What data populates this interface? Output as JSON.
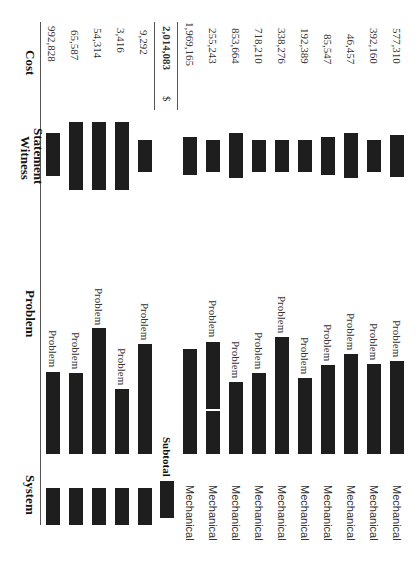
{
  "table": {
    "headers": {
      "system": "System",
      "problem": "Problem",
      "witness_statement_line1": "Witness",
      "witness_statement_line2": "Statement",
      "cost": "Cost"
    },
    "group1_rows": [
      {
        "system": "[redacted]",
        "problem": "Problem",
        "witness": "[redacted]",
        "cost": "992,828"
      },
      {
        "system": "[redacted]",
        "problem": "Problem",
        "witness": "[redacted]",
        "cost": "65,587"
      },
      {
        "system": "[redacted]",
        "problem": "Problem",
        "witness": "[redacted]",
        "cost": "54,314"
      },
      {
        "system": "[redacted]",
        "problem": "Problem",
        "witness": "[redacted]",
        "cost": "3,416"
      },
      {
        "system": "[redacted]",
        "problem": "Problem",
        "witness": "[redacted]",
        "cost": "9,292"
      }
    ],
    "subtotal": {
      "label": "Subtotal",
      "currency": "$",
      "value": "2,014,083"
    },
    "group2_rows": [
      {
        "system": "Mechanical",
        "problem": "",
        "witness": "[redacted]",
        "cost": "1,969,165"
      },
      {
        "system": "Mechanical",
        "problem": "Problem",
        "witness": "[redacted]",
        "cost": "255,243"
      },
      {
        "system": "Mechanical",
        "problem": "Problem",
        "witness": "[redacted]",
        "cost": "853,664"
      },
      {
        "system": "Mechanical",
        "problem": "Problem",
        "witness": "[redacted]",
        "cost": "718,210"
      },
      {
        "system": "Mechanical",
        "problem": "Problem",
        "witness": "[redacted]",
        "cost": "338,276"
      },
      {
        "system": "Mechanical",
        "problem": "Problem",
        "witness": "[redacted]",
        "cost": "192,389"
      },
      {
        "system": "Mechanical",
        "problem": "Problem",
        "witness": "[redacted]",
        "cost": "85,547"
      },
      {
        "system": "Mechanical",
        "problem": "Problem",
        "witness": "[redacted]",
        "cost": "46,457"
      },
      {
        "system": "Mechanical",
        "problem": "Problem",
        "witness": "[redacted]",
        "cost": "392,160"
      },
      {
        "system": "Mechanical",
        "problem": "Problem",
        "witness": "[redacted]",
        "cost": "577,310"
      }
    ]
  }
}
